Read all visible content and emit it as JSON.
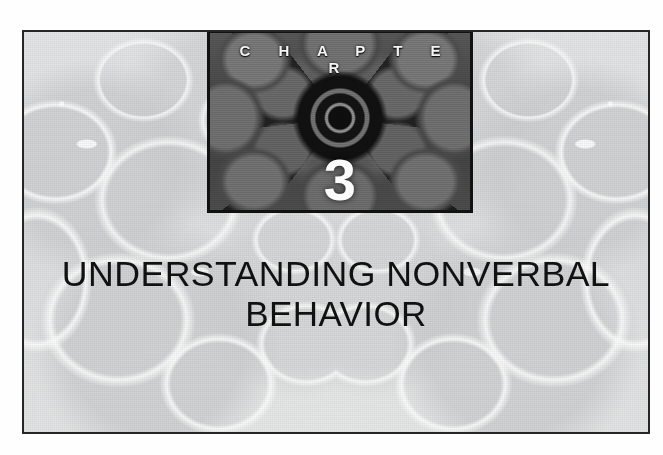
{
  "page": {
    "background_color": "#ffffff",
    "plate_border_color": "#262626",
    "plate_background_color": "#e6e7e8"
  },
  "chapter_box": {
    "label": "C H A P T E R",
    "number": "3",
    "border_color": "#111111",
    "text_color": "#f4f4f4",
    "artwork_name": "kaleidoscope-mandala"
  },
  "title": {
    "line1": "UNDERSTANDING NONVERBAL",
    "line2": "BEHAVIOR",
    "text_color": "#111111"
  }
}
